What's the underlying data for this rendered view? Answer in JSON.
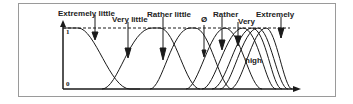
{
  "diagram": {
    "type": "fuzzy membership functions",
    "y_axis": {
      "top_label": "1",
      "bottom_label": "0"
    },
    "terms": [
      {
        "label": "Extremely little"
      },
      {
        "label": "Very little"
      },
      {
        "label": "Rather little"
      },
      {
        "label": "Ø"
      },
      {
        "label": "Rather"
      },
      {
        "label": "Very"
      },
      {
        "label": "Extremely"
      }
    ],
    "base_term": "high",
    "colors": {
      "line": "#1a1a1a",
      "frame": "#9a9a9a",
      "background": "#ffffff"
    }
  }
}
